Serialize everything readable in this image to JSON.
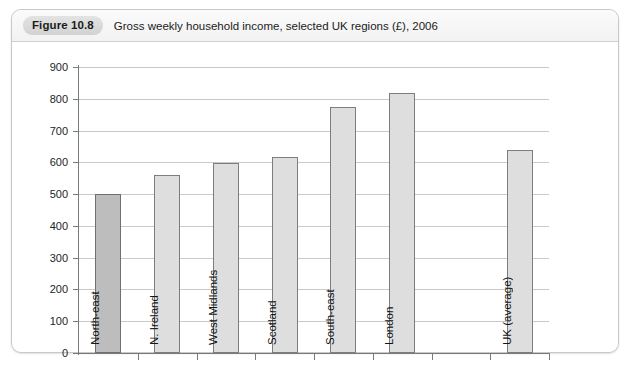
{
  "figure": {
    "badge": "Figure 10.8",
    "caption": "Gross weekly household income, selected UK regions (£), 2006"
  },
  "chart_data": {
    "type": "bar",
    "title": "Gross weekly household income, selected UK regions (£), 2006",
    "xlabel": "",
    "ylabel": "",
    "ylim": [
      0,
      900
    ],
    "ytick_step": 100,
    "yticks": [
      0,
      100,
      200,
      300,
      400,
      500,
      600,
      700,
      800,
      900
    ],
    "grid": true,
    "legend": "none",
    "categories": [
      "North-east",
      "N. Ireland",
      "West Midlands",
      "Scotland",
      "South-east",
      "London",
      "",
      "UK (average)"
    ],
    "values": [
      500,
      560,
      597,
      616,
      775,
      818,
      null,
      640
    ],
    "bars": [
      {
        "label": "North-east",
        "value": 500,
        "color": "#bdbdbd",
        "highlight": true
      },
      {
        "label": "N. Ireland",
        "value": 560,
        "color": "#dedede",
        "highlight": false
      },
      {
        "label": "West Midlands",
        "value": 597,
        "color": "#dedede",
        "highlight": false
      },
      {
        "label": "Scotland",
        "value": 616,
        "color": "#dedede",
        "highlight": false
      },
      {
        "label": "South-east",
        "value": 775,
        "color": "#dedede",
        "highlight": false
      },
      {
        "label": "London",
        "value": 818,
        "color": "#dedede",
        "highlight": false
      },
      {
        "label": "",
        "value": null,
        "color": "#dedede",
        "highlight": false
      },
      {
        "label": "UK (average)",
        "value": 640,
        "color": "#dedede",
        "highlight": false
      }
    ],
    "colors": {
      "bar_fill": "#dedede",
      "bar_fill_highlight": "#bdbdbd",
      "bar_border": "#7d7d7d",
      "gridline": "#c9c9c9",
      "axis": "#7a7a7a",
      "text": "#141414"
    }
  }
}
